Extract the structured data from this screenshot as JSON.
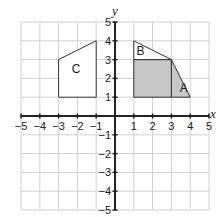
{
  "axes": {
    "x_label": "x",
    "y_label": "y",
    "x_range": [
      -5,
      5
    ],
    "y_range": [
      -5,
      5
    ],
    "x_ticks": [
      "-5",
      "-4",
      "-3",
      "-2",
      "-1",
      "1",
      "2",
      "3",
      "4",
      "5"
    ],
    "y_ticks": [
      "5",
      "4",
      "3",
      "2",
      "1",
      "-1",
      "-2",
      "-3",
      "-4",
      "-5"
    ]
  },
  "shapes": [
    {
      "label": "A",
      "points": [
        [
          3,
          1
        ],
        [
          4,
          1
        ],
        [
          3,
          3
        ]
      ],
      "fill": "#c8c8c8"
    },
    {
      "label": "B",
      "points": [
        [
          1,
          3
        ],
        [
          3,
          3
        ],
        [
          1,
          4
        ]
      ],
      "fill": "#ffffff"
    },
    {
      "label": "C",
      "points": [
        [
          -3,
          1
        ],
        [
          -1,
          1
        ],
        [
          -1,
          4
        ],
        [
          -3,
          3
        ]
      ],
      "fill": "#ffffff"
    }
  ],
  "shaded_square": {
    "points": [
      [
        1,
        1
      ],
      [
        3,
        1
      ],
      [
        3,
        3
      ],
      [
        1,
        3
      ]
    ],
    "fill": "#c8c8c8"
  },
  "colors": {
    "grid": "#d0d0d0",
    "axis": "#222222",
    "shape_stroke": "#333333"
  }
}
